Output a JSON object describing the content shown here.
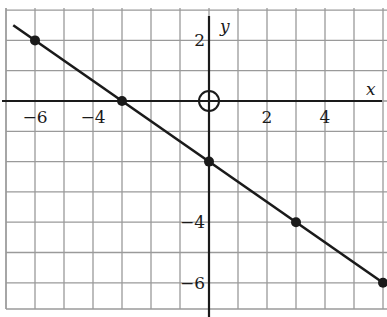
{
  "chart_data": {
    "type": "line",
    "title": "",
    "xlabel": "x",
    "ylabel": "y",
    "xlim": [
      -7,
      6
    ],
    "ylim": [
      -7,
      3
    ],
    "grid": true,
    "grid_step": 1,
    "x_ticks": [
      {
        "value": -6,
        "label": "−6"
      },
      {
        "value": -4,
        "label": "−4"
      },
      {
        "value": 2,
        "label": "2"
      },
      {
        "value": 4,
        "label": "4"
      }
    ],
    "y_ticks": [
      {
        "value": 2,
        "label": "2"
      },
      {
        "value": -4,
        "label": "−4"
      },
      {
        "value": -6,
        "label": "−6"
      }
    ],
    "origin_marker": "circle",
    "series": [
      {
        "name": "line",
        "slope": -0.6667,
        "intercept": -2,
        "points": [
          {
            "x": -6,
            "y": 2
          },
          {
            "x": -3,
            "y": 0
          },
          {
            "x": 0,
            "y": -2
          },
          {
            "x": 3,
            "y": -4
          },
          {
            "x": 6,
            "y": -6
          }
        ],
        "line_extent": {
          "x_start": -6.75,
          "x_end": 6
        }
      }
    ]
  },
  "labels": {
    "x_axis": "x",
    "y_axis": "y"
  },
  "colors": {
    "grid": "#9a9a9a",
    "axis": "#1a1a1a",
    "line": "#1a1a1a",
    "background": "#ffffff"
  }
}
